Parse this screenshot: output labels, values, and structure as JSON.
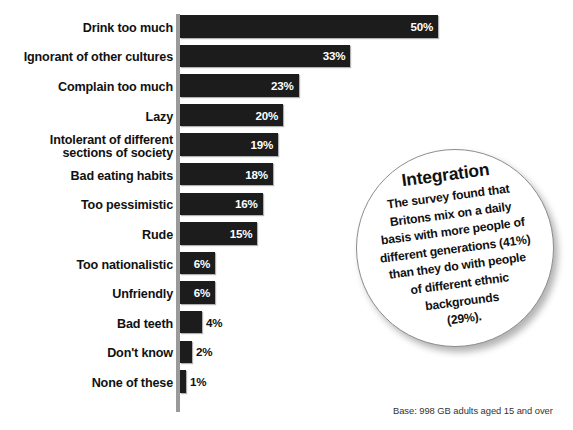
{
  "chart_data": {
    "type": "bar",
    "title": "",
    "xlabel": "",
    "ylabel": "",
    "orientation": "horizontal",
    "grid": false,
    "legend": "none",
    "xlim": [
      0,
      50
    ],
    "categories": [
      "Drink too much",
      "Ignorant of other cultures",
      "Complain too much",
      "Lazy",
      "Intolerant of different\nsections of society",
      "Bad eating habits",
      "Too pessimistic",
      "Rude",
      "Too nationalistic",
      "Unfriendly",
      "Bad teeth",
      "Don't know",
      "None of these"
    ],
    "values": [
      50,
      33,
      23,
      20,
      19,
      18,
      16,
      15,
      6,
      6,
      4,
      2,
      1
    ],
    "value_labels": [
      "50%",
      "33%",
      "23%",
      "20%",
      "19%",
      "18%",
      "16%",
      "15%",
      "6%",
      "6%",
      "4%",
      "2%",
      "1%"
    ],
    "label_placement": [
      "inside",
      "inside",
      "inside",
      "inside",
      "inside",
      "inside",
      "inside",
      "inside",
      "inside",
      "inside",
      "outside",
      "outside",
      "outside"
    ],
    "bar_color": "#1c1c1c",
    "inside_label_color": "#ffffff",
    "outside_label_color": "#111111",
    "axis_color": "#9a9a9a",
    "background_color": "#ffffff"
  },
  "callout": {
    "title": "Integration",
    "lines": [
      "The survey found that",
      "Britons mix on a daily",
      "basis with more people of",
      "different generations (41%)",
      "than they do with people",
      "of different ethnic",
      "backgrounds",
      "(29%)."
    ],
    "border_color": "#8d8d8d"
  },
  "footnote": {
    "base": "Base: 998 GB adults aged 15 and over"
  }
}
